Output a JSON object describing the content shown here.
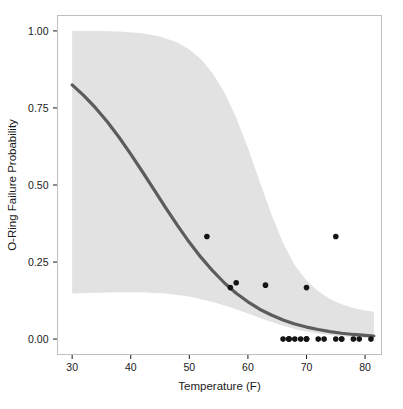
{
  "chart_data": {
    "type": "scatter",
    "title": "",
    "subtitle": "",
    "xlabel": "Temperature (F)",
    "ylabel": "O-Ring Failure Probability",
    "xlim": [
      27.5,
      82.8
    ],
    "ylim": [
      -0.05,
      1.05
    ],
    "xticks": [
      30,
      40,
      50,
      60,
      70,
      80
    ],
    "xtick_labels": [
      "30",
      "40",
      "50",
      "60",
      "70",
      "80"
    ],
    "yticks": [
      0.0,
      0.25,
      0.5,
      0.75,
      1.0
    ],
    "ytick_labels": [
      "0.00",
      "0.25",
      "0.50",
      "0.75",
      "1.00"
    ],
    "grid": false,
    "legend": "none",
    "panel_background": "#ffffff",
    "panel_border_color": "#bfbfbf",
    "series": [
      {
        "name": "Observed O-ring failure fraction",
        "type": "scatter",
        "marker": "filled-circle",
        "color": "#141414",
        "marker_size": 5.6,
        "points": [
          {
            "x": 53,
            "y": 0.333
          },
          {
            "x": 57,
            "y": 0.167
          },
          {
            "x": 58,
            "y": 0.183
          },
          {
            "x": 63,
            "y": 0.175
          },
          {
            "x": 66,
            "y": 0.0
          },
          {
            "x": 67,
            "y": 0.0
          },
          {
            "x": 67,
            "y": 0.0
          },
          {
            "x": 67,
            "y": 0.0
          },
          {
            "x": 68,
            "y": 0.0
          },
          {
            "x": 69,
            "y": 0.0
          },
          {
            "x": 70,
            "y": 0.0
          },
          {
            "x": 70,
            "y": 0.0
          },
          {
            "x": 70,
            "y": 0.167
          },
          {
            "x": 70,
            "y": 0.0
          },
          {
            "x": 72,
            "y": 0.0
          },
          {
            "x": 73,
            "y": 0.0
          },
          {
            "x": 75,
            "y": 0.0
          },
          {
            "x": 75,
            "y": 0.333
          },
          {
            "x": 76,
            "y": 0.0
          },
          {
            "x": 76,
            "y": 0.0
          },
          {
            "x": 78,
            "y": 0.0
          },
          {
            "x": 79,
            "y": 0.0
          },
          {
            "x": 81,
            "y": 0.0
          }
        ]
      },
      {
        "name": "Logistic fit",
        "type": "line",
        "color": "#5c5c5c",
        "line_width": 3.2,
        "points": [
          {
            "x": 30,
            "y": 0.825
          },
          {
            "x": 32,
            "y": 0.79
          },
          {
            "x": 34,
            "y": 0.75
          },
          {
            "x": 36,
            "y": 0.705
          },
          {
            "x": 38,
            "y": 0.655
          },
          {
            "x": 40,
            "y": 0.6
          },
          {
            "x": 42,
            "y": 0.543
          },
          {
            "x": 44,
            "y": 0.484
          },
          {
            "x": 46,
            "y": 0.425
          },
          {
            "x": 48,
            "y": 0.368
          },
          {
            "x": 50,
            "y": 0.314
          },
          {
            "x": 52,
            "y": 0.265
          },
          {
            "x": 54,
            "y": 0.221
          },
          {
            "x": 56,
            "y": 0.182
          },
          {
            "x": 58,
            "y": 0.149
          },
          {
            "x": 60,
            "y": 0.121
          },
          {
            "x": 62,
            "y": 0.097
          },
          {
            "x": 64,
            "y": 0.078
          },
          {
            "x": 66,
            "y": 0.062
          },
          {
            "x": 68,
            "y": 0.049
          },
          {
            "x": 70,
            "y": 0.039
          },
          {
            "x": 72,
            "y": 0.031
          },
          {
            "x": 74,
            "y": 0.024
          },
          {
            "x": 76,
            "y": 0.019
          },
          {
            "x": 78,
            "y": 0.015
          },
          {
            "x": 80,
            "y": 0.012
          },
          {
            "x": 81.5,
            "y": 0.01
          }
        ]
      }
    ],
    "confidence_band": {
      "name": "Confidence interval",
      "fill_color": "#e2e2e2",
      "upper": [
        {
          "x": 30,
          "y": 1.0
        },
        {
          "x": 34,
          "y": 1.0
        },
        {
          "x": 38,
          "y": 0.998
        },
        {
          "x": 42,
          "y": 0.992
        },
        {
          "x": 45,
          "y": 0.982
        },
        {
          "x": 48,
          "y": 0.962
        },
        {
          "x": 50,
          "y": 0.94
        },
        {
          "x": 52,
          "y": 0.908
        },
        {
          "x": 54,
          "y": 0.862
        },
        {
          "x": 56,
          "y": 0.8
        },
        {
          "x": 58,
          "y": 0.718
        },
        {
          "x": 60,
          "y": 0.62
        },
        {
          "x": 62,
          "y": 0.512
        },
        {
          "x": 64,
          "y": 0.405
        },
        {
          "x": 66,
          "y": 0.312
        },
        {
          "x": 68,
          "y": 0.24
        },
        {
          "x": 70,
          "y": 0.19
        },
        {
          "x": 72,
          "y": 0.155
        },
        {
          "x": 74,
          "y": 0.13
        },
        {
          "x": 76,
          "y": 0.113
        },
        {
          "x": 78,
          "y": 0.101
        },
        {
          "x": 80,
          "y": 0.093
        },
        {
          "x": 81.5,
          "y": 0.089
        }
      ],
      "lower": [
        {
          "x": 30,
          "y": 0.148
        },
        {
          "x": 34,
          "y": 0.15
        },
        {
          "x": 38,
          "y": 0.152
        },
        {
          "x": 42,
          "y": 0.152
        },
        {
          "x": 46,
          "y": 0.148
        },
        {
          "x": 50,
          "y": 0.138
        },
        {
          "x": 54,
          "y": 0.12
        },
        {
          "x": 57,
          "y": 0.103
        },
        {
          "x": 60,
          "y": 0.083
        },
        {
          "x": 63,
          "y": 0.062
        },
        {
          "x": 66,
          "y": 0.043
        },
        {
          "x": 69,
          "y": 0.028
        },
        {
          "x": 72,
          "y": 0.018
        },
        {
          "x": 75,
          "y": 0.011
        },
        {
          "x": 78,
          "y": 0.006
        },
        {
          "x": 81.5,
          "y": 0.003
        }
      ]
    }
  }
}
